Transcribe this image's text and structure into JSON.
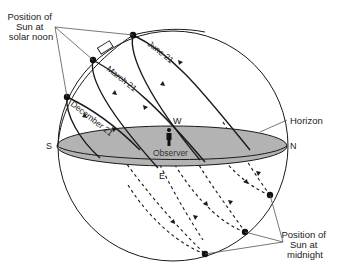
{
  "diagram": {
    "callouts": {
      "noon": {
        "lines": [
          "Position of",
          "Sun at",
          "solar noon"
        ]
      },
      "midnight": {
        "lines": [
          "Position of",
          "Sun at",
          "midnight"
        ]
      },
      "horizon": "Horizon"
    },
    "directions": {
      "south": "S",
      "north": "N",
      "east": "E",
      "west": "W"
    },
    "observer": "Observer",
    "paths": [
      {
        "label": "June 21"
      },
      {
        "label": "March 21"
      },
      {
        "label": "December 21"
      }
    ],
    "colors": {
      "line": "#1a1a1a",
      "horizon_fill": "#b3b3b3",
      "callout_line": "#555555",
      "background": "#ffffff"
    }
  }
}
